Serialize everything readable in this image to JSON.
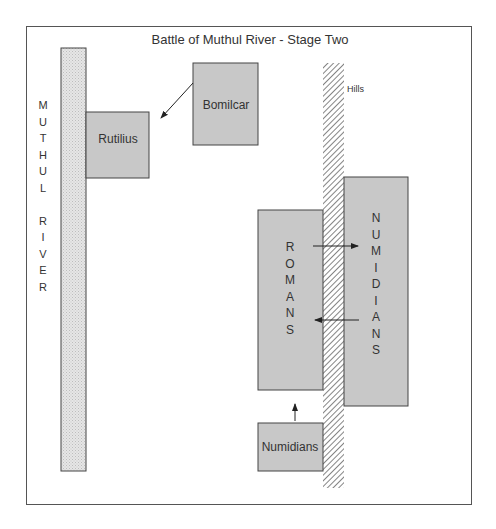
{
  "diagram": {
    "title": "Battle of Muthul River - Stage Two",
    "river_label": [
      "M",
      "U",
      "T",
      "H",
      "U",
      "L",
      "",
      "R",
      "I",
      "V",
      "E",
      "R"
    ],
    "hills_label": "Hills",
    "units": {
      "rutilius": "Rutilius",
      "bomilcar": "Bomilcar",
      "romans_letters": [
        "R",
        "O",
        "M",
        "A",
        "N",
        "S"
      ],
      "numidians_letters": [
        "N",
        "U",
        "M",
        "I",
        "D",
        "I",
        "A",
        "N",
        "S"
      ],
      "numidians_bottom": "Numidians"
    },
    "arrows": [
      {
        "from": "Bomilcar",
        "to": "Rutilius"
      },
      {
        "from": "Romans",
        "to": "Numidians"
      },
      {
        "from": "Numidians",
        "to": "Romans"
      },
      {
        "from": "Numidians (bottom)",
        "to": "Romans"
      }
    ],
    "colors": {
      "unit_fill": "#c8c8c8",
      "river_fill": "#e0e0e0",
      "stroke": "#333333"
    }
  }
}
